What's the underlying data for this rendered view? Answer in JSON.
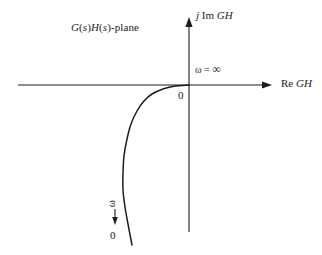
{
  "figure": {
    "background_color": "#ffffff",
    "line_color": "#1c1c1c"
  },
  "labels": {
    "plane": "G(s)H(s)-plane",
    "plane_parts": {
      "g": "G",
      "open1": "(",
      "s1": "s",
      "close1": ")",
      "h": "H",
      "open2": "(",
      "s2": "s",
      "close2": ")",
      "suffix": "-plane"
    },
    "imag_axis": "j Im GH",
    "imag_axis_parts": {
      "j": "j",
      "im": "Im",
      "gh": "GH"
    },
    "real_axis": "Re GH",
    "real_axis_parts": {
      "re": "Re",
      "gh": "GH"
    },
    "omega_infinity": "ω = ∞",
    "omega_infinity_parts": {
      "omega": "ω",
      "equals": "=",
      "infinity": "∞"
    },
    "origin_zero": "0",
    "omega_arrow_symbol": "ω",
    "omega_arrow_direction": "↓",
    "omega_endpoint_zero": "0"
  },
  "chart_data": {
    "type": "line",
    "title": "G(s)H(s)-plane",
    "xlabel": "Re GH",
    "ylabel": "j Im GH",
    "grid": false,
    "legend": null,
    "axes": {
      "real": {
        "label": "Re GH",
        "orientation": "horizontal",
        "arrow_at": "right",
        "pixel_y": 85,
        "pixel_x_start": 18,
        "pixel_x_end": 272
      },
      "imag": {
        "label": "j Im GH",
        "orientation": "vertical",
        "arrow_at": "top",
        "pixel_x": 189,
        "pixel_y_start": 18,
        "pixel_y_end": 232
      },
      "origin": {
        "pixel_x": 189,
        "pixel_y": 85,
        "label": "0"
      }
    },
    "series": [
      {
        "name": "GH(jω) locus",
        "quadrant": "third",
        "description": "Locus leaves the origin tangent to the negative real axis at ω = ∞ and sweeps downward into the third quadrant, ending in the lower half-plane as ω → 0.",
        "points_pixel": [
          [
            189,
            85
          ],
          [
            175,
            86
          ],
          [
            163,
            89
          ],
          [
            152,
            94
          ],
          [
            144,
            101
          ],
          [
            137,
            111
          ],
          [
            131,
            124
          ],
          [
            127,
            139
          ],
          [
            124,
            156
          ],
          [
            123,
            173
          ],
          [
            123,
            190
          ],
          [
            125,
            207
          ],
          [
            128,
            224
          ],
          [
            132,
            245
          ]
        ],
        "endpoints": {
          "start": {
            "omega": "∞",
            "label": "ω = ∞",
            "pixel": [
              189,
              85
            ]
          },
          "end": {
            "omega": "0",
            "label": "0",
            "pixel": [
              132,
              245
            ]
          }
        }
      }
    ],
    "annotations": [
      {
        "text": "G(s)H(s)-plane",
        "pixel": [
          71,
          22
        ],
        "role": "plane-caption"
      },
      {
        "text": "ω = ∞",
        "pixel": [
          195,
          63
        ],
        "role": "omega-infinity-marker"
      },
      {
        "text": "0",
        "pixel": [
          178,
          90
        ],
        "role": "origin-marker"
      },
      {
        "text": "ω",
        "pixel": [
          108,
          198
        ],
        "role": "omega-direction-symbol",
        "rotation_deg": -90
      },
      {
        "text": "↓",
        "pixel": [
          112,
          213
        ],
        "role": "omega-direction-arrow"
      },
      {
        "text": "0",
        "pixel": [
          110,
          230
        ],
        "role": "omega-zero-endpoint"
      }
    ]
  }
}
